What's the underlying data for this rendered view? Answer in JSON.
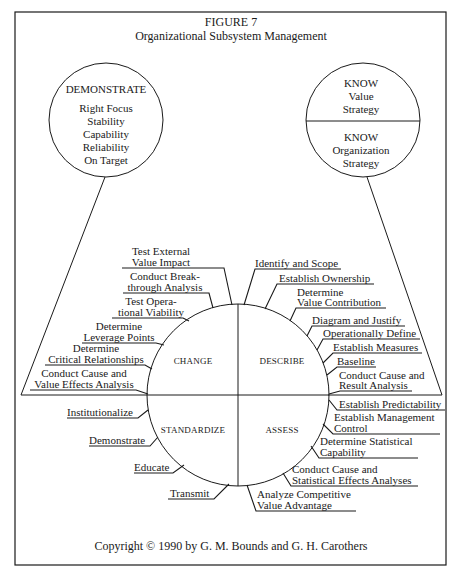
{
  "figure": {
    "number": "FIGURE 7",
    "title": "Organizational Subsystem Management",
    "copyright": "Copyright © 1990 by G. M. Bounds and G. H. Carothers"
  },
  "demonstrate_circle": {
    "heading": "DEMONSTRATE",
    "items": [
      "Right Focus",
      "Stability",
      "Capability",
      "Reliability",
      "On Target"
    ]
  },
  "know_circle": {
    "top": {
      "heading": "KNOW",
      "line1": "Value",
      "line2": "Strategy"
    },
    "bottom": {
      "heading": "KNOW",
      "line1": "Organization",
      "line2": "Strategy"
    }
  },
  "quadrants": {
    "change": "CHANGE",
    "describe": "DESCRIBE",
    "standardize": "STANDARDIZE",
    "assess": "ASSESS"
  },
  "change_steps": [
    [
      "Test External",
      "Value Impact"
    ],
    [
      "Conduct Break-",
      "through Analysis"
    ],
    [
      "Test Opera-",
      "tional Viability"
    ],
    [
      "Determine",
      "Leverage Points"
    ],
    [
      "Determine",
      "Critical Relationships"
    ],
    [
      "Conduct Cause and",
      "Value Effects Analysis"
    ]
  ],
  "describe_steps": [
    [
      "Identify and Scope"
    ],
    [
      "Establish Ownership"
    ],
    [
      "Determine",
      "Value Contribution"
    ],
    [
      "Diagram and Justify"
    ],
    [
      "Operationally Define"
    ],
    [
      "Establish Measures"
    ],
    [
      "Baseline"
    ],
    [
      "Conduct Cause and",
      "Result Analysis"
    ]
  ],
  "standardize_steps": [
    [
      "Institutionalize"
    ],
    [
      "Demonstrate"
    ],
    [
      "Educate"
    ],
    [
      "Transmit"
    ]
  ],
  "assess_steps": [
    [
      "Establish Predictability"
    ],
    [
      "Establish Management",
      "Control"
    ],
    [
      "Determine Statistical",
      "Capability"
    ],
    [
      "Conduct Cause and",
      "Statistical Effects Analyses"
    ],
    [
      "Analyze Competitive",
      "Value Advantage"
    ]
  ]
}
